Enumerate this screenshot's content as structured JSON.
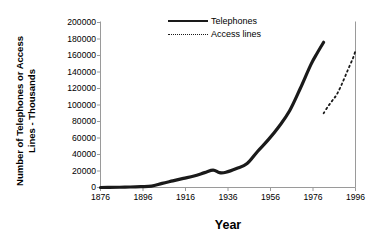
{
  "chart_data": {
    "type": "line",
    "title": "",
    "xlabel": "Year",
    "ylabel_line1": "Number of Telephones or Access",
    "ylabel_line2": "Lines - Thousands",
    "xlim": [
      1876,
      1996
    ],
    "ylim": [
      0,
      200000
    ],
    "grid": false,
    "legend_position": "top-center",
    "xticks": [
      "1876",
      "1896",
      "1916",
      "1936",
      "1956",
      "1976",
      "1996"
    ],
    "xtick_values": [
      1876,
      1896,
      1916,
      1936,
      1956,
      1976,
      1996
    ],
    "yticks": [
      "200000",
      "180000",
      "160000",
      "140000",
      "120000",
      "100000",
      "80000",
      "60000",
      "40000",
      "20000",
      "0"
    ],
    "ytick_values": [
      200000,
      180000,
      160000,
      140000,
      120000,
      100000,
      80000,
      60000,
      40000,
      20000,
      0
    ],
    "series": [
      {
        "name": "Telephones",
        "style": "solid",
        "color": "#1a1a1a",
        "width": 3.2,
        "x": [
          1876,
          1880,
          1885,
          1890,
          1895,
          1900,
          1905,
          1910,
          1915,
          1920,
          1925,
          1929,
          1932,
          1935,
          1940,
          1945,
          1950,
          1955,
          1960,
          1965,
          1970,
          1975,
          1978,
          1981
        ],
        "values": [
          0,
          100,
          300,
          600,
          1000,
          1600,
          5000,
          8000,
          11000,
          14000,
          18000,
          21000,
          18000,
          18500,
          23000,
          29000,
          44000,
          58000,
          74000,
          93000,
          120000,
          149000,
          163000,
          176000
        ]
      },
      {
        "name": "Access lines",
        "style": "dotted",
        "color": "#1a1a1a",
        "width": 1.8,
        "x": [
          1981,
          1983,
          1985,
          1987,
          1989,
          1991,
          1993,
          1995,
          1996
        ],
        "values": [
          90000,
          98000,
          105000,
          112000,
          122000,
          134000,
          146000,
          158000,
          166000
        ]
      }
    ]
  },
  "legend": {
    "items": [
      {
        "label": "Telephones",
        "style": "solid"
      },
      {
        "label": "Access lines",
        "style": "dotted"
      }
    ]
  },
  "axes": {
    "frame_color": "#9a9a9a",
    "text_color": "#000000"
  }
}
